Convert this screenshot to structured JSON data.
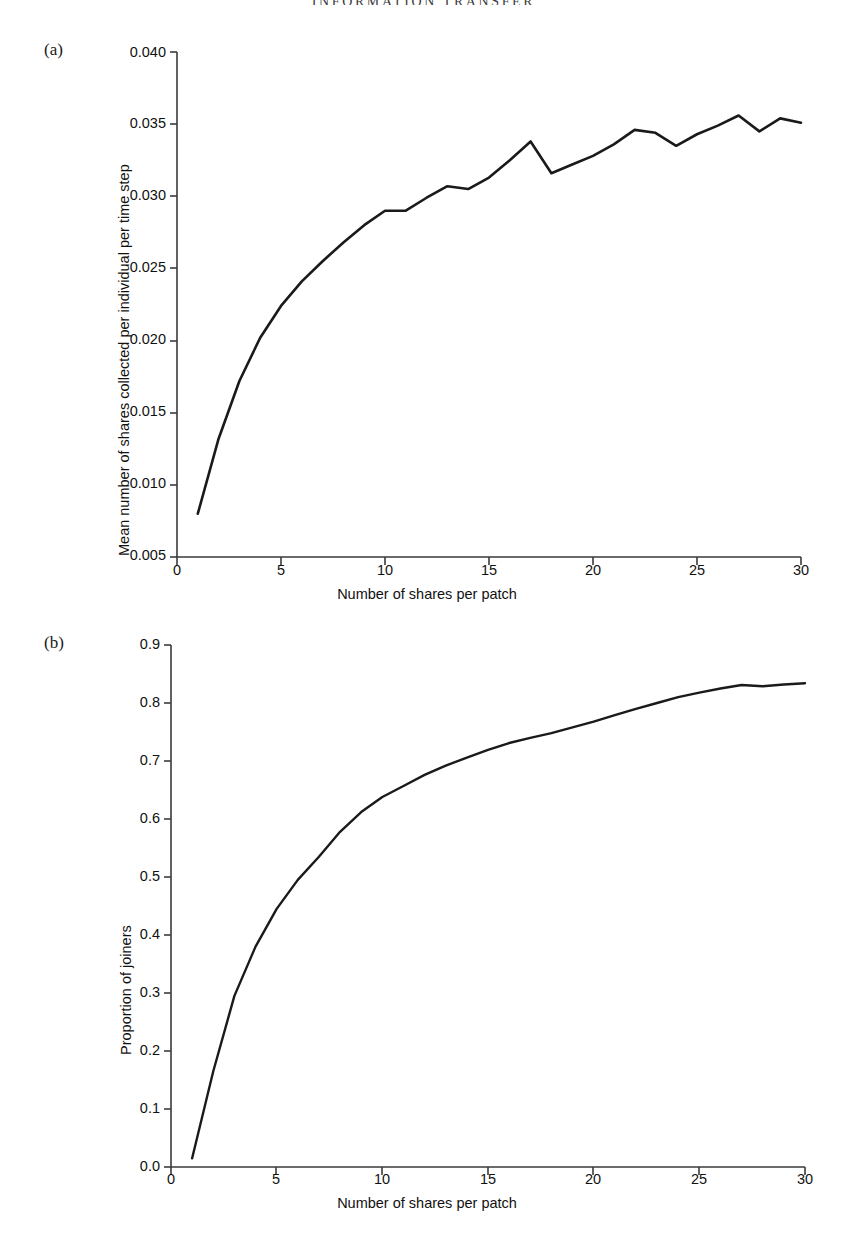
{
  "running_head": "INFORMATION TRANSFER",
  "figure": {
    "panels": [
      {
        "label": "(a)",
        "name": "panel-a"
      },
      {
        "label": "(b)",
        "name": "panel-b"
      }
    ]
  },
  "chart_data": [
    {
      "type": "line",
      "panel": "(a)",
      "title": "",
      "xlabel": "Number of shares per patch",
      "ylabel": "Mean number of shares collected per individual per time step",
      "xlim": [
        0,
        30
      ],
      "ylim": [
        0.005,
        0.04
      ],
      "xticks": [
        0,
        5,
        10,
        15,
        20,
        25,
        30
      ],
      "xticklabels": [
        "0",
        "5",
        "10",
        "15",
        "20",
        "25",
        "30"
      ],
      "yticks": [
        0.005,
        0.01,
        0.015,
        0.02,
        0.025,
        0.03,
        0.035,
        0.04
      ],
      "yticklabels": [
        "0.005",
        "0.010",
        "0.015",
        "0.020",
        "0.025",
        "0.030",
        "0.035",
        "0.040"
      ],
      "grid": false,
      "legend": null,
      "line_color": "#1a1a1a",
      "x": [
        1,
        2,
        3,
        4,
        5,
        6,
        7,
        8,
        9,
        10,
        11,
        12,
        13,
        14,
        15,
        16,
        17,
        18,
        19,
        20,
        21,
        22,
        23,
        24,
        25,
        26,
        27,
        28,
        29,
        30
      ],
      "values": [
        0.008,
        0.0132,
        0.0172,
        0.0202,
        0.0224,
        0.0241,
        0.0255,
        0.0268,
        0.028,
        0.029,
        0.029,
        0.0299,
        0.0307,
        0.0305,
        0.0313,
        0.0325,
        0.0338,
        0.0316,
        0.0322,
        0.0328,
        0.0336,
        0.0346,
        0.0344,
        0.0335,
        0.0343,
        0.0349,
        0.0356,
        0.0345,
        0.0354,
        0.0351
      ]
    },
    {
      "type": "line",
      "panel": "(b)",
      "title": "",
      "xlabel": "Number of shares per patch",
      "ylabel": "Proportion of joiners",
      "xlim": [
        0,
        30
      ],
      "ylim": [
        0.0,
        0.9
      ],
      "xticks": [
        0,
        5,
        10,
        15,
        20,
        25,
        30
      ],
      "xticklabels": [
        "0",
        "5",
        "10",
        "15",
        "20",
        "25",
        "30"
      ],
      "yticks": [
        0.0,
        0.1,
        0.2,
        0.3,
        0.4,
        0.5,
        0.6,
        0.7,
        0.8,
        0.9
      ],
      "yticklabels": [
        "0.0",
        "0.1",
        "0.2",
        "0.3",
        "0.4",
        "0.5",
        "0.6",
        "0.7",
        "0.8",
        "0.9"
      ],
      "grid": false,
      "legend": null,
      "line_color": "#1a1a1a",
      "x": [
        1,
        2,
        3,
        4,
        5,
        6,
        7,
        8,
        9,
        10,
        11,
        12,
        13,
        14,
        15,
        16,
        17,
        18,
        19,
        20,
        21,
        22,
        23,
        24,
        25,
        26,
        27,
        28,
        29,
        30
      ],
      "values": [
        0.015,
        0.165,
        0.295,
        0.38,
        0.445,
        0.495,
        0.535,
        0.578,
        0.612,
        0.638,
        0.657,
        0.676,
        0.692,
        0.706,
        0.719,
        0.731,
        0.74,
        0.748,
        0.758,
        0.768,
        0.779,
        0.79,
        0.8,
        0.81,
        0.818,
        0.825,
        0.831,
        0.829,
        0.832,
        0.834
      ]
    }
  ]
}
